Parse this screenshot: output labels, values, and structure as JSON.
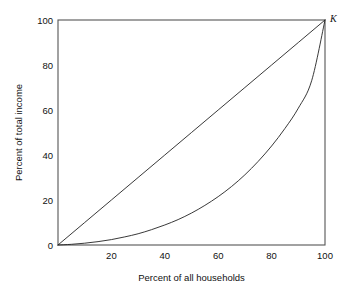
{
  "figure": {
    "name": "lorenz-curve-figure",
    "background_color": "#ffffff",
    "frame_color": "#555555",
    "line_color": "#222222"
  },
  "labels": {
    "xlabel": "Percent of all households",
    "ylabel": "Percent of total income",
    "point_k": "K"
  },
  "axes": {
    "x_ticks": [
      "20",
      "40",
      "60",
      "80",
      "100"
    ],
    "y_ticks": [
      "0",
      "20",
      "40",
      "60",
      "80",
      "100"
    ]
  },
  "chart_data": {
    "type": "line",
    "title": "",
    "subtitle": "",
    "xlabel": "Percent of all households",
    "ylabel": "Percent of total income",
    "xlim": [
      0,
      100
    ],
    "ylim": [
      0,
      100
    ],
    "xticks": [
      20,
      40,
      60,
      80,
      100
    ],
    "yticks": [
      0,
      20,
      40,
      60,
      80,
      100
    ],
    "grid": false,
    "legend": false,
    "legend_position": "none",
    "annotations": [
      {
        "text": "K",
        "x": 100,
        "y": 100,
        "style": "italic",
        "placement": "outside-top-right",
        "description": "labels the point of perfect-equality endpoint at (100,100)"
      }
    ],
    "series": [
      {
        "name": "Line of perfect equality",
        "type": "line",
        "x": [
          0,
          10,
          20,
          30,
          40,
          50,
          60,
          70,
          80,
          90,
          100
        ],
        "y": [
          0,
          10,
          20,
          30,
          40,
          50,
          60,
          70,
          80,
          90,
          100
        ]
      },
      {
        "name": "Lorenz curve",
        "type": "line",
        "x": [
          0,
          5,
          10,
          15,
          20,
          25,
          30,
          35,
          40,
          45,
          50,
          55,
          60,
          65,
          70,
          75,
          80,
          85,
          90,
          95,
          100
        ],
        "y": [
          0,
          0.3,
          0.8,
          1.5,
          2.4,
          3.6,
          5.0,
          6.8,
          8.9,
          11.3,
          14.2,
          17.6,
          21.5,
          26.0,
          31.2,
          37.2,
          44.0,
          51.8,
          60.8,
          73.0,
          100
        ]
      }
    ]
  }
}
